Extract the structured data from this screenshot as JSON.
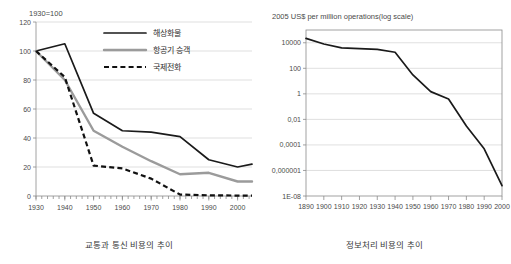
{
  "figure": {
    "bottom_cut_text": ""
  },
  "left_panel": {
    "axis_note": "1930=100",
    "caption": "교통과 통신 비용의 추이"
  },
  "right_panel": {
    "axis_note": "2005 US$ per million operations(log scale)",
    "caption": "정보처리 비용의 추이"
  },
  "chart_data": [
    {
      "type": "line",
      "title": "교통과 통신 비용의 추이",
      "subtitle": "1930=100",
      "xlabel": "",
      "ylabel": "",
      "xlim": [
        1930,
        2005
      ],
      "ylim": [
        0,
        120
      ],
      "yticks": [
        0,
        20,
        40,
        60,
        80,
        100,
        120
      ],
      "xticks": [
        1930,
        1940,
        1950,
        1960,
        1970,
        1980,
        1990,
        2000
      ],
      "grid": true,
      "legend_position": "top-center",
      "x": [
        1930,
        1940,
        1950,
        1960,
        1970,
        1980,
        1990,
        2000,
        2005
      ],
      "series": [
        {
          "name": "해상화물",
          "style": "solid",
          "color": "#1a1a1a",
          "values": [
            100,
            105,
            57,
            45,
            44,
            41,
            25,
            20,
            22
          ]
        },
        {
          "name": "항공기 승객",
          "style": "solid",
          "color": "#9b9b9b",
          "values": [
            100,
            80,
            45,
            34,
            24,
            15,
            16,
            10,
            10
          ]
        },
        {
          "name": "국제전화",
          "style": "dashed",
          "color": "#111111",
          "values": [
            100,
            82,
            21,
            19,
            12,
            1,
            0.5,
            0.3,
            0.3
          ]
        }
      ]
    },
    {
      "type": "line",
      "title": "정보처리 비용의 추이",
      "subtitle": "2005 US$ per million operations(log scale)",
      "xlabel": "",
      "ylabel": "",
      "scale": "log",
      "xlim": [
        1890,
        2000
      ],
      "ylim": [
        1e-08,
        100000
      ],
      "yticks": [
        10000,
        100,
        1,
        0.01,
        0.0001,
        1e-06,
        1e-08
      ],
      "ytick_labels": [
        "10000",
        "100",
        "1",
        "0,01",
        "0,0001",
        "0,000001",
        "1E-08"
      ],
      "xticks": [
        1890,
        1900,
        1910,
        1920,
        1930,
        1940,
        1950,
        1960,
        1970,
        1980,
        1990,
        2000
      ],
      "grid": true,
      "legend_position": "none",
      "x": [
        1890,
        1900,
        1910,
        1920,
        1930,
        1940,
        1950,
        1960,
        1970,
        1980,
        1990,
        2000
      ],
      "series": [
        {
          "name": "정보처리 비용",
          "style": "solid",
          "color": "#1a1a1a",
          "values": [
            22000,
            8000,
            4000,
            3500,
            3000,
            1800,
            30,
            1.5,
            0.4,
            0.003,
            5e-05,
            6.5e-08
          ]
        }
      ]
    }
  ]
}
